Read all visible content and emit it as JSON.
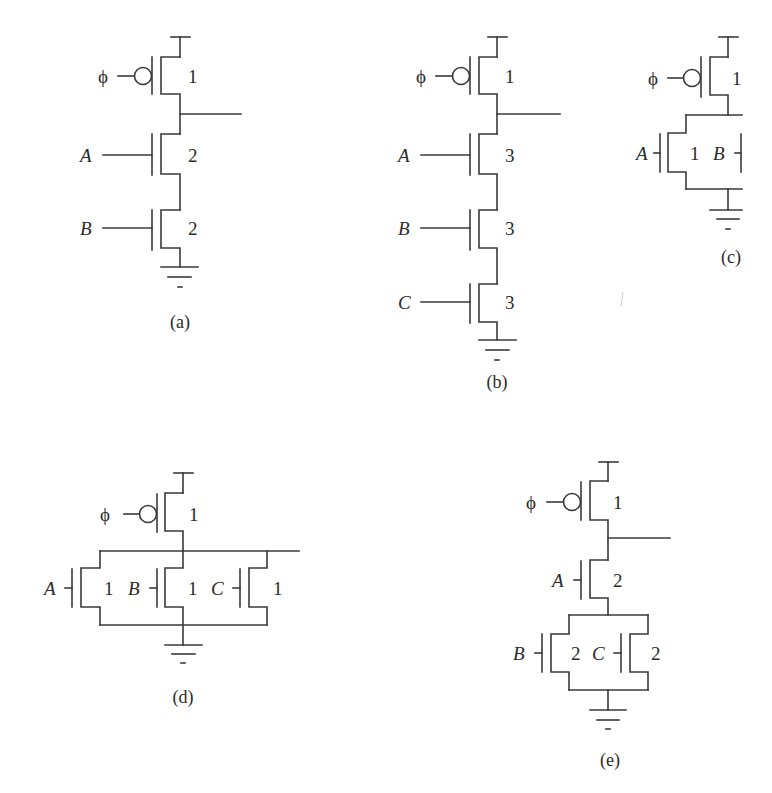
{
  "figure": {
    "stroke_color": "#3a3a3a",
    "text_color": "#2a2a2a",
    "panels": [
      {
        "id": "a",
        "caption": "(a)",
        "clock": "ϕ",
        "pmos_size": "1",
        "inputs": [
          {
            "name": "A",
            "size": "2"
          },
          {
            "name": "B",
            "size": "2"
          }
        ],
        "topology": "series NMOS"
      },
      {
        "id": "b",
        "caption": "(b)",
        "clock": "ϕ",
        "pmos_size": "1",
        "inputs": [
          {
            "name": "A",
            "size": "3"
          },
          {
            "name": "B",
            "size": "3"
          },
          {
            "name": "C",
            "size": "3"
          }
        ],
        "topology": "series NMOS"
      },
      {
        "id": "c",
        "caption": "(c)",
        "clock": "ϕ",
        "pmos_size": "1",
        "inputs": [
          {
            "name": "A",
            "size": "1"
          },
          {
            "name": "B",
            "size": ""
          }
        ],
        "topology": "parallel NMOS (cropped at right edge)"
      },
      {
        "id": "d",
        "caption": "(d)",
        "clock": "ϕ",
        "pmos_size": "1",
        "inputs": [
          {
            "name": "A",
            "size": "1"
          },
          {
            "name": "B",
            "size": "1"
          },
          {
            "name": "C",
            "size": "1"
          }
        ],
        "topology": "parallel NMOS"
      },
      {
        "id": "e",
        "caption": "(e)",
        "clock": "ϕ",
        "pmos_size": "1",
        "inputs": [
          {
            "name": "A",
            "size": "2"
          },
          {
            "name": "B",
            "size": "2"
          },
          {
            "name": "C",
            "size": "2"
          }
        ],
        "topology": "A in series with (B parallel C)"
      }
    ]
  }
}
